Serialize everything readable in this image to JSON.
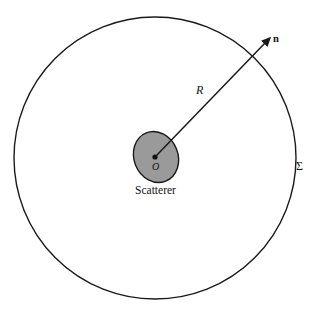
{
  "figure": {
    "type": "scattering-geometry-diagram",
    "background_color": "#ffffff",
    "stroke_color": "#1a1a1a",
    "scatterer_fill_color": "#9a9a9a",
    "outer_surface": {
      "name": "enclosing-spherical-surface",
      "label": "Σ",
      "center_x": 155,
      "center_y": 158,
      "radius": 141,
      "stroke_width": 1.4
    },
    "scatterer": {
      "name": "scatterer-body",
      "label": "Scatterer",
      "center_x": 156,
      "center_y": 157,
      "radius_x": 22,
      "radius_y": 26,
      "rotation_deg": -22,
      "stroke_width": 1.4
    },
    "origin": {
      "name": "origin-point",
      "label": "O",
      "x": 155,
      "y": 157,
      "dot_radius": 2.6
    },
    "radius_vector": {
      "name": "radius-vector",
      "label": "R",
      "normal_label": "n",
      "from_x": 155,
      "from_y": 157,
      "to_x": 269,
      "to_y": 39,
      "stroke_width": 1.5,
      "arrowhead": true
    }
  }
}
